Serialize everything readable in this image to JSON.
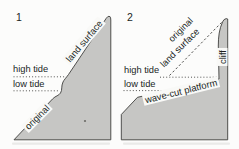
{
  "figure": {
    "colors": {
      "background": "#fcfcfb",
      "land_fill": "#c6c6c4",
      "outline": "#3f3f3d",
      "text": "#201f1d",
      "label_bg": "#f9f9f7"
    },
    "panel1": {
      "number": "1",
      "land_surface_label": "land surface",
      "high_tide_label": "high tide",
      "low_tide_label": "low tide",
      "original_label": "original"
    },
    "panel2": {
      "number": "2",
      "original_label": "original",
      "land_surface_label": "land surface",
      "high_tide_label": "high tide",
      "low_tide_label": "low tide",
      "cliff_label": "cliff",
      "platform_label": "wave-cut platform"
    }
  }
}
